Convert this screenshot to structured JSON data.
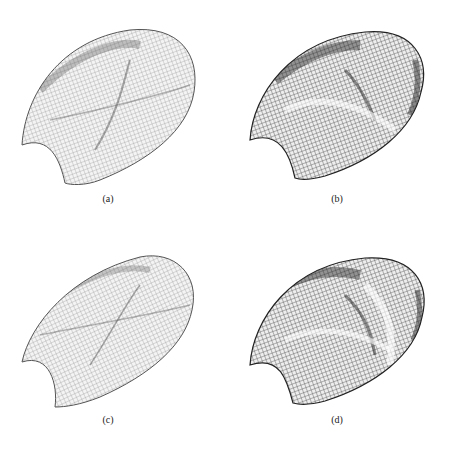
{
  "figure": {
    "panels": [
      {
        "id": "a",
        "label": "(a)",
        "style": "light-wireframe",
        "shade": "#7a7a7a"
      },
      {
        "id": "b",
        "label": "(b)",
        "style": "dark-shaded-wireframe",
        "shade": "#3a3a3a"
      },
      {
        "id": "c",
        "label": "(c)",
        "style": "light-wireframe",
        "shade": "#7a7a7a"
      },
      {
        "id": "d",
        "label": "(d)",
        "style": "dark-shaded-wireframe",
        "shade": "#3a3a3a"
      }
    ]
  }
}
